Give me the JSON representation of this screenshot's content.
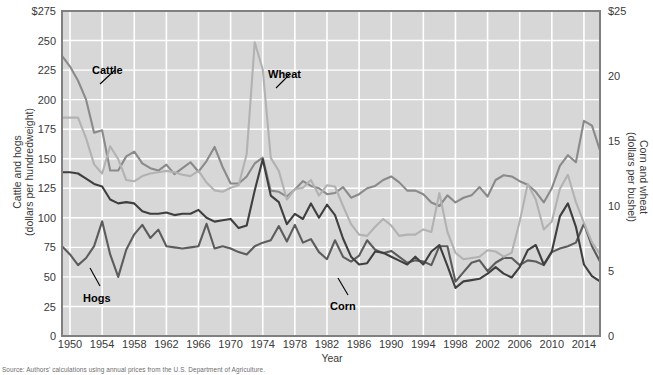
{
  "chart_data": {
    "type": "line",
    "title": "",
    "xlabel": "Year",
    "ylabel_left": "Cattle and hogs\n(dollars per hundredweight)",
    "ylabel_left_line1": "Cattle and hogs",
    "ylabel_left_line2": "(dollars per hundredweight)",
    "ylabel_right_line1": "Corn and wheat",
    "ylabel_right_line2": "(dollars per bushel)",
    "grid": true,
    "legend_position": "inline-annotations",
    "xlim": [
      1949,
      2016
    ],
    "x_ticks": [
      "1950",
      "1954",
      "1958",
      "1962",
      "1966",
      "1970",
      "1974",
      "1978",
      "1982",
      "1986",
      "1990",
      "1994",
      "1998",
      "2002",
      "2006",
      "2010",
      "2014"
    ],
    "x_tick_values": [
      1950,
      1954,
      1958,
      1962,
      1966,
      1970,
      1974,
      1978,
      1982,
      1986,
      1990,
      1994,
      1998,
      2002,
      2006,
      2010,
      2014
    ],
    "ylim_left": [
      0,
      275
    ],
    "y_ticks_left": [
      "0",
      "25",
      "50",
      "75",
      "100",
      "125",
      "150",
      "175",
      "200",
      "225",
      "250",
      "$275"
    ],
    "y_tick_values_left": [
      0,
      25,
      50,
      75,
      100,
      125,
      150,
      175,
      200,
      225,
      250,
      275
    ],
    "ylim_right": [
      0,
      25
    ],
    "y_ticks_right": [
      "0",
      "5",
      "10",
      "15",
      "20",
      "$25"
    ],
    "y_tick_values_right": [
      0,
      5,
      10,
      15,
      20,
      25
    ],
    "x": [
      1949,
      1950,
      1951,
      1952,
      1953,
      1954,
      1955,
      1956,
      1957,
      1958,
      1959,
      1960,
      1961,
      1962,
      1963,
      1964,
      1965,
      1966,
      1967,
      1968,
      1969,
      1970,
      1971,
      1972,
      1973,
      1974,
      1975,
      1976,
      1977,
      1978,
      1979,
      1980,
      1981,
      1982,
      1983,
      1984,
      1985,
      1986,
      1987,
      1988,
      1989,
      1990,
      1991,
      1992,
      1993,
      1994,
      1995,
      1996,
      1997,
      1998,
      1999,
      2000,
      2001,
      2002,
      2003,
      2004,
      2005,
      2006,
      2007,
      2008,
      2009,
      2010,
      2011,
      2012,
      2013,
      2014,
      2015,
      2016
    ],
    "series": [
      {
        "name": "Cattle",
        "axis": "left",
        "unit": "dollars per hundredweight",
        "color": "#8a8a8a",
        "values": [
          237,
          228,
          216,
          200,
          172,
          174,
          140,
          140,
          152,
          156,
          146,
          142,
          140,
          145,
          137,
          142,
          147,
          139,
          148,
          160,
          143,
          129,
          129,
          135,
          146,
          151,
          123,
          122,
          118,
          124,
          131,
          127,
          125,
          120,
          121,
          126,
          117,
          120,
          125,
          127,
          132,
          135,
          130,
          123,
          123,
          120,
          113,
          110,
          119,
          113,
          117,
          119,
          126,
          118,
          132,
          136,
          135,
          131,
          128,
          122,
          113,
          125,
          144,
          153,
          147,
          182,
          178,
          157
        ]
      },
      {
        "name": "Hogs",
        "axis": "left",
        "unit": "dollars per hundredweight",
        "color": "#5c5c5c",
        "values": [
          76,
          69,
          60,
          66,
          76,
          97,
          69,
          50,
          73,
          86,
          94,
          83,
          90,
          76,
          75,
          74,
          75,
          76,
          95,
          74,
          76,
          74,
          71,
          69,
          76,
          79,
          81,
          93,
          80,
          94,
          79,
          82,
          71,
          65,
          81,
          67,
          63,
          68,
          81,
          73,
          70,
          72,
          67,
          62,
          64,
          63,
          60,
          76,
          76,
          46,
          54,
          62,
          64,
          55,
          62,
          66,
          66,
          60,
          64,
          63,
          60,
          71,
          74,
          76,
          79,
          95,
          76,
          63
        ]
      },
      {
        "name": "Wheat",
        "axis": "right",
        "unit": "dollars per bushel",
        "color": "#b2b2b2",
        "values": [
          16.8,
          16.8,
          16.8,
          15.2,
          13.2,
          12.5,
          14.6,
          13.6,
          12.0,
          11.9,
          12.3,
          12.5,
          12.6,
          12.7,
          12.6,
          12.4,
          12.3,
          12.7,
          11.8,
          11.2,
          11.1,
          11.4,
          11.6,
          14.0,
          22.6,
          20.5,
          13.7,
          12.7,
          10.5,
          11.3,
          11.4,
          12.0,
          10.8,
          11.6,
          11.5,
          10.0,
          8.6,
          7.8,
          7.7,
          8.4,
          9.0,
          8.5,
          7.7,
          7.8,
          7.8,
          8.2,
          8.0,
          11.0,
          8.0,
          6.4,
          5.9,
          6.0,
          6.1,
          6.6,
          6.5,
          6.1,
          6.4,
          8.8,
          11.7,
          10.5,
          8.2,
          8.8,
          11.3,
          12.4,
          10.3,
          8.7,
          7.2,
          6.3
        ]
      },
      {
        "name": "Corn",
        "axis": "right",
        "unit": "dollars per bushel",
        "color": "#3f3f3f",
        "values": [
          12.6,
          12.6,
          12.5,
          12.1,
          11.7,
          11.5,
          10.5,
          10.2,
          10.3,
          10.2,
          9.6,
          9.4,
          9.4,
          9.5,
          9.3,
          9.4,
          9.4,
          9.7,
          9.1,
          8.8,
          8.9,
          9.0,
          8.3,
          8.5,
          11.2,
          13.6,
          10.8,
          10.3,
          8.6,
          9.4,
          9.0,
          10.2,
          9.1,
          10.1,
          9.3,
          7.5,
          6.1,
          5.5,
          5.6,
          6.5,
          6.4,
          6.1,
          5.8,
          5.5,
          6.1,
          5.5,
          6.5,
          7.0,
          5.4,
          3.7,
          4.2,
          4.3,
          4.4,
          4.8,
          5.3,
          4.8,
          4.5,
          5.3,
          6.6,
          7.0,
          5.5,
          6.5,
          9.2,
          10.2,
          8.4,
          5.5,
          4.6,
          4.2
        ]
      }
    ],
    "annotations": [
      {
        "label": "Cattle",
        "x_px": 92,
        "y_px": 64
      },
      {
        "label": "Wheat",
        "x_px": 268,
        "y_px": 68
      },
      {
        "label": "Hogs",
        "x_px": 83,
        "y_px": 292
      },
      {
        "label": "Corn",
        "x_px": 330,
        "y_px": 300
      }
    ]
  },
  "source_note": "Source: Authors' calculations using annual prices from the U.S. Department of Agriculture.",
  "plot": {
    "bg_color": "#d7d7d7",
    "grid_color": "#ffffff",
    "border_color": "#808080"
  }
}
